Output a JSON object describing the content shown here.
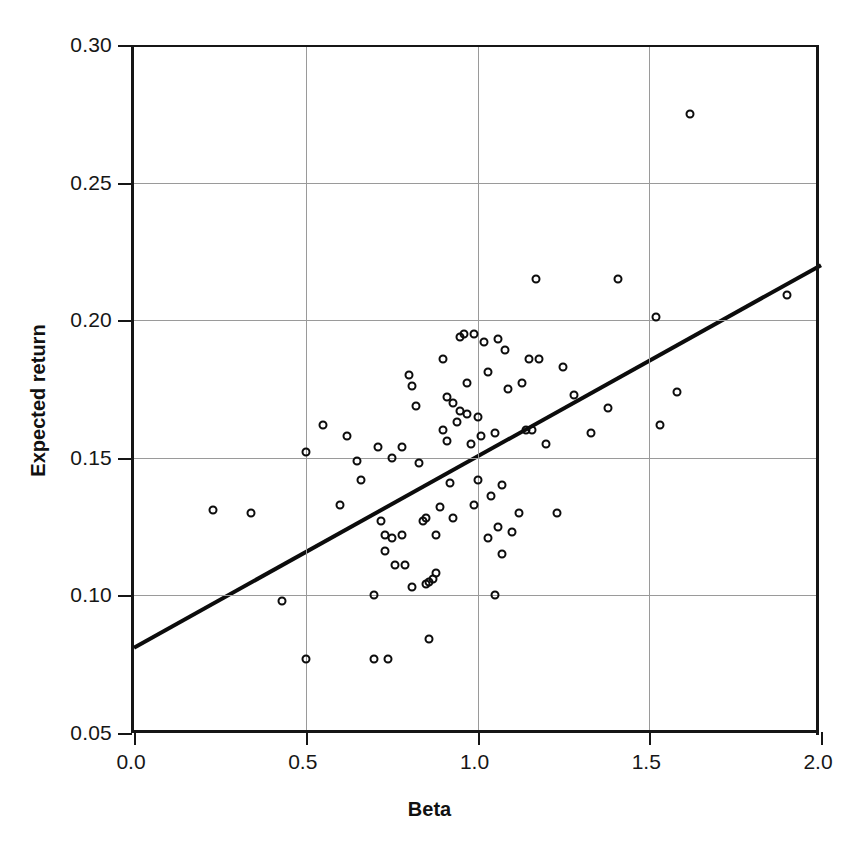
{
  "chart_data": {
    "type": "scatter",
    "title": "",
    "xlabel": "Beta",
    "ylabel": "Expected return",
    "xlim": [
      0.0,
      2.0
    ],
    "ylim": [
      0.05,
      0.3
    ],
    "xticks": [
      0.0,
      0.5,
      1.0,
      1.5,
      2.0
    ],
    "yticks": [
      0.05,
      0.1,
      0.15,
      0.2,
      0.25,
      0.3
    ],
    "xtick_labels": [
      "0.0",
      "0.5",
      "1.0",
      "1.5",
      "2.0"
    ],
    "ytick_labels": [
      "0.05",
      "0.10",
      "0.15",
      "0.20",
      "0.25",
      "0.30"
    ],
    "grid": true,
    "grid_color": "#9a9a9a",
    "marker": "open-circle",
    "marker_color": "#0c0c0c",
    "legend": null,
    "series": [
      {
        "name": "securities",
        "type": "scatter",
        "points": [
          [
            0.23,
            0.131
          ],
          [
            0.34,
            0.13
          ],
          [
            0.43,
            0.098
          ],
          [
            0.5,
            0.152
          ],
          [
            0.5,
            0.077
          ],
          [
            0.55,
            0.162
          ],
          [
            0.6,
            0.133
          ],
          [
            0.62,
            0.158
          ],
          [
            0.65,
            0.149
          ],
          [
            0.66,
            0.142
          ],
          [
            0.7,
            0.1
          ],
          [
            0.7,
            0.077
          ],
          [
            0.71,
            0.154
          ],
          [
            0.72,
            0.127
          ],
          [
            0.73,
            0.122
          ],
          [
            0.73,
            0.116
          ],
          [
            0.74,
            0.077
          ],
          [
            0.75,
            0.15
          ],
          [
            0.75,
            0.121
          ],
          [
            0.76,
            0.111
          ],
          [
            0.78,
            0.154
          ],
          [
            0.78,
            0.122
          ],
          [
            0.79,
            0.111
          ],
          [
            0.8,
            0.18
          ],
          [
            0.81,
            0.176
          ],
          [
            0.81,
            0.103
          ],
          [
            0.82,
            0.169
          ],
          [
            0.83,
            0.148
          ],
          [
            0.84,
            0.127
          ],
          [
            0.85,
            0.128
          ],
          [
            0.85,
            0.104
          ],
          [
            0.86,
            0.105
          ],
          [
            0.86,
            0.084
          ],
          [
            0.87,
            0.106
          ],
          [
            0.88,
            0.122
          ],
          [
            0.88,
            0.108
          ],
          [
            0.89,
            0.132
          ],
          [
            0.9,
            0.186
          ],
          [
            0.9,
            0.16
          ],
          [
            0.91,
            0.172
          ],
          [
            0.91,
            0.156
          ],
          [
            0.92,
            0.141
          ],
          [
            0.93,
            0.17
          ],
          [
            0.93,
            0.128
          ],
          [
            0.94,
            0.163
          ],
          [
            0.95,
            0.194
          ],
          [
            0.95,
            0.167
          ],
          [
            0.96,
            0.195
          ],
          [
            0.97,
            0.177
          ],
          [
            0.97,
            0.166
          ],
          [
            0.98,
            0.155
          ],
          [
            0.99,
            0.195
          ],
          [
            0.99,
            0.133
          ],
          [
            1.0,
            0.165
          ],
          [
            1.0,
            0.142
          ],
          [
            1.01,
            0.158
          ],
          [
            1.02,
            0.192
          ],
          [
            1.03,
            0.181
          ],
          [
            1.03,
            0.121
          ],
          [
            1.04,
            0.136
          ],
          [
            1.05,
            0.159
          ],
          [
            1.05,
            0.1
          ],
          [
            1.06,
            0.193
          ],
          [
            1.06,
            0.125
          ],
          [
            1.07,
            0.14
          ],
          [
            1.07,
            0.115
          ],
          [
            1.08,
            0.189
          ],
          [
            1.09,
            0.175
          ],
          [
            1.1,
            0.123
          ],
          [
            1.12,
            0.13
          ],
          [
            1.13,
            0.177
          ],
          [
            1.14,
            0.16
          ],
          [
            1.15,
            0.186
          ],
          [
            1.16,
            0.16
          ],
          [
            1.17,
            0.215
          ],
          [
            1.18,
            0.186
          ],
          [
            1.2,
            0.155
          ],
          [
            1.23,
            0.13
          ],
          [
            1.25,
            0.183
          ],
          [
            1.28,
            0.173
          ],
          [
            1.33,
            0.159
          ],
          [
            1.38,
            0.168
          ],
          [
            1.41,
            0.215
          ],
          [
            1.52,
            0.201
          ],
          [
            1.53,
            0.162
          ],
          [
            1.58,
            0.174
          ],
          [
            1.62,
            0.275
          ],
          [
            1.9,
            0.209
          ]
        ]
      },
      {
        "name": "security-market-line",
        "type": "line",
        "x": [
          0.0,
          2.0
        ],
        "y": [
          0.081,
          0.22
        ]
      }
    ]
  }
}
